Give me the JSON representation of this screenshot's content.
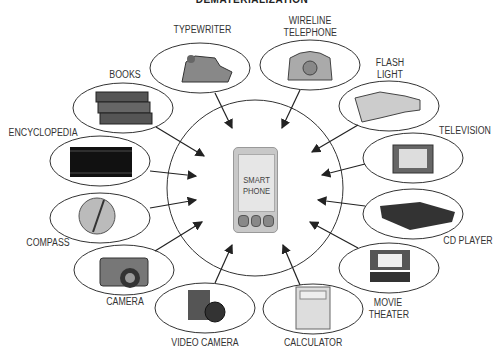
{
  "title": "DEMATERIALIZATION",
  "center": {
    "label_line1": "SMART",
    "label_line2": "PHONE"
  },
  "items": [
    {
      "id": "typewriter",
      "label": "TYPEWRITER"
    },
    {
      "id": "wireline-telephone",
      "label": "WIRELINE TELEPHONE"
    },
    {
      "id": "flash-light",
      "label": "FLASH LIGHT"
    },
    {
      "id": "television",
      "label": "TELEVISION"
    },
    {
      "id": "cd-player",
      "label": "CD PLAYER"
    },
    {
      "id": "movie-theater",
      "label": "MOVIE THEATER"
    },
    {
      "id": "calculator",
      "label": "CALCULATOR"
    },
    {
      "id": "video-camera",
      "label": "VIDEO CAMERA"
    },
    {
      "id": "camera",
      "label": "CAMERA"
    },
    {
      "id": "compass",
      "label": "COMPASS"
    },
    {
      "id": "encyclopedia",
      "label": "ENCYCLOPEDIA"
    },
    {
      "id": "books",
      "label": "BOOKS"
    }
  ]
}
